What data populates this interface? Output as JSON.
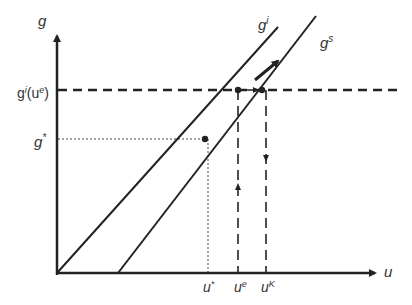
{
  "diagram": {
    "axes": {
      "y_label": "g",
      "x_label": "u"
    },
    "curves": [
      {
        "name": "investment-line",
        "label_base": "g",
        "label_sup": "i"
      },
      {
        "name": "savings-line",
        "label_base": "g",
        "label_sup": "s"
      }
    ],
    "y_ticks": [
      {
        "label_base": "g",
        "label_sup": "i",
        "label_rest": "(u",
        "label_sup2": "e",
        "label_end": ")"
      },
      {
        "label_base": "g",
        "label_sup": "*"
      }
    ],
    "x_ticks": [
      {
        "label_base": "u",
        "label_sup": "*"
      },
      {
        "label_base": "u",
        "label_sup": "e"
      },
      {
        "label_base": "u",
        "label_sup": "K"
      }
    ],
    "colors": {
      "line": "#222222",
      "text": "#333333"
    }
  }
}
